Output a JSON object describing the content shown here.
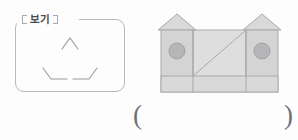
{
  "page": {
    "width": 298,
    "height": 140,
    "background_color": "#fdfdfd",
    "ink_color": "#b0b0b5"
  },
  "example_box": {
    "label": "보기",
    "label_ticks": "bracket-tick",
    "border_color": "#b9b9bd",
    "figure": {
      "name": "gapped-triangle",
      "description": "triangle outline drawn only at the three corners (apex and two base corners), sides have gaps",
      "stroke_color": "#9a9aa0",
      "corners": [
        {
          "name": "apex-corner",
          "points": "47,30 55,19 63,30"
        },
        {
          "name": "bottom-left-corner",
          "points": "28,49 36,60 52,60"
        },
        {
          "name": "bottom-right-corner",
          "points": "58,60 74,60 82,49"
        }
      ]
    }
  },
  "house_figure": {
    "name": "two-tower-house",
    "description": "a house / castle made of two side towers with triangular roofs, a central body, a circular window on each tower, a horizontal base band and a diagonal line across the central body",
    "colors": {
      "roof_fill": "#d9d9da",
      "tower_fill": "#d4d4d5",
      "body_fill": "#dedede",
      "band_fill": "#d9d9d9",
      "window_fill": "#b6b6b8",
      "stroke": "#a9a9ac"
    },
    "parts": [
      {
        "name": "left-roof",
        "type": "triangle",
        "points": "8,24 27,8 46,24"
      },
      {
        "name": "right-roof",
        "type": "triangle",
        "points": "93,24 112,8 131,24"
      },
      {
        "name": "left-tower",
        "type": "rect",
        "x": 11,
        "y": 24,
        "w": 32,
        "h": 62
      },
      {
        "name": "right-tower",
        "type": "rect",
        "x": 96,
        "y": 24,
        "w": 32,
        "h": 62
      },
      {
        "name": "center-body",
        "type": "rect",
        "x": 43,
        "y": 24,
        "w": 53,
        "h": 62
      },
      {
        "name": "base-band",
        "type": "rect",
        "x": 11,
        "y": 70,
        "w": 117,
        "h": 16
      },
      {
        "name": "left-window",
        "type": "circle",
        "cx": 27,
        "cy": 45,
        "r": 8
      },
      {
        "name": "right-window",
        "type": "circle",
        "cx": 112,
        "cy": 45,
        "r": 8
      },
      {
        "name": "diagonal-line",
        "type": "line",
        "x1": 43,
        "y1": 70,
        "x2": 96,
        "y2": 24
      }
    ]
  },
  "answer": {
    "open_paren": "(",
    "close_paren": ")"
  }
}
